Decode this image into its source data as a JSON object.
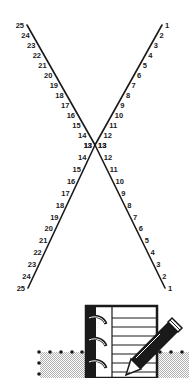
{
  "diagram": {
    "type": "string-art",
    "colors": {
      "line": "#1a1a1a",
      "label": "#1a1a1a",
      "stipple": "#c8c8c8"
    },
    "top_figure": {
      "left_line": {
        "start": [
          27,
          25
        ],
        "end": [
          95,
          145
        ],
        "labels_top_to_bottom": [
          25,
          24,
          23,
          22,
          21,
          20,
          19,
          18,
          17,
          16,
          15,
          14,
          13
        ]
      },
      "right_line": {
        "start": [
          162,
          25
        ],
        "end": [
          95,
          145
        ],
        "labels_top_to_bottom": [
          1,
          2,
          3,
          4,
          5,
          6,
          7,
          8,
          9,
          10,
          11,
          12,
          13
        ]
      }
    },
    "bottom_figure": {
      "left_line": {
        "start": [
          95,
          145
        ],
        "end": [
          28,
          288
        ],
        "labels_top_to_bottom": [
          13,
          14,
          15,
          16,
          17,
          18,
          19,
          20,
          21,
          22,
          23,
          24,
          25
        ]
      },
      "right_line": {
        "start": [
          95,
          145
        ],
        "end": [
          165,
          288
        ],
        "labels_top_to_bottom": [
          13,
          12,
          11,
          10,
          9,
          8,
          7,
          6,
          5,
          4,
          3,
          2,
          1
        ]
      }
    }
  },
  "footer_icon": {
    "name": "notebook-with-pencil",
    "dotted_border": true
  }
}
